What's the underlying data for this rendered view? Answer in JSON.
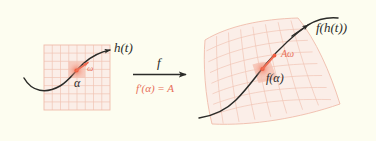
{
  "figure": {
    "background_color": "#fdfdf0",
    "curve_color": "#2b2b28",
    "accent_color": "#e8705a",
    "grid_fill": "#fbeee8",
    "grid_line": "#f0c4b4",
    "highlight_fill": "#f6c4b6"
  },
  "left_panel": {
    "name": "domain-grid-panel",
    "curve_label": "h(t)",
    "point_label": "α",
    "tangent_label": "ω",
    "grid_cells": 8
  },
  "map_arrow": {
    "name": "function-arrow",
    "label": "f",
    "derivative_label": "f′(α) = A"
  },
  "right_panel": {
    "name": "codomain-grid-panel",
    "curve_label": "f(h(t))",
    "point_label": "f(α)",
    "tangent_label": "Aω",
    "grid_cells": 8
  }
}
